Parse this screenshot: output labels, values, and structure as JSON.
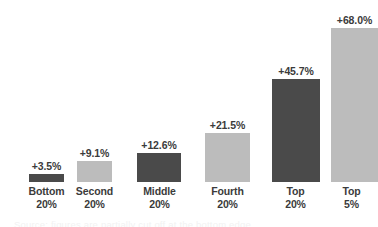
{
  "chart_data": {
    "type": "bar",
    "title": "",
    "subtitle": "",
    "xlabel": "",
    "ylabel": "",
    "categories": [
      {
        "line1": "Bottom",
        "line2": "20%"
      },
      {
        "line1": "Second",
        "line2": "20%"
      },
      {
        "line1": "Middle",
        "line2": "20%"
      },
      {
        "line1": "Fourth",
        "line2": "20%"
      },
      {
        "line1": "Top",
        "line2": "20%"
      },
      {
        "line1": "Top",
        "line2": "5%"
      }
    ],
    "values": [
      3.5,
      9.1,
      12.6,
      21.5,
      45.7,
      68.0
    ],
    "value_labels": [
      "+3.5%",
      "+9.1%",
      "+12.6%",
      "+21.5%",
      "+45.7%",
      "+68.0%"
    ],
    "bar_colors": [
      "#4a4a4a",
      "#bcbcbc",
      "#4a4a4a",
      "#bcbcbc",
      "#4a4a4a",
      "#bcbcbc"
    ],
    "ylim": [
      0,
      68
    ],
    "grid": false,
    "legend": "none",
    "axis_line": false
  },
  "bars": [
    {
      "category_line1": "Bottom",
      "category_line2": "20%",
      "value_label": "+3.5%",
      "value": 3.5,
      "color": "#4a4a4a"
    },
    {
      "category_line1": "Second",
      "category_line2": "20%",
      "value_label": "+9.1%",
      "value": 9.1,
      "color": "#bcbcbc"
    },
    {
      "category_line1": "Middle",
      "category_line2": "20%",
      "value_label": "+12.6%",
      "value": 12.6,
      "color": "#4a4a4a"
    },
    {
      "category_line1": "Fourth",
      "category_line2": "20%",
      "value_label": "+21.5%",
      "value": 21.5,
      "color": "#bcbcbc"
    },
    {
      "category_line1": "Top",
      "category_line2": "20%",
      "value_label": "+45.7%",
      "value": 45.7,
      "color": "#4a4a4a"
    },
    {
      "category_line1": "Top",
      "category_line2": "5%",
      "value_label": "+68.0%",
      "value": 68.0,
      "color": "#bcbcbc"
    }
  ],
  "caption": {
    "clipped_text": "Source: figures are partially cut off at the bottom edge"
  },
  "colors": {
    "dark_bar": "#4a4a4a",
    "light_bar": "#bcbcbc",
    "text": "#3b3b3b",
    "background": "#ffffff"
  }
}
